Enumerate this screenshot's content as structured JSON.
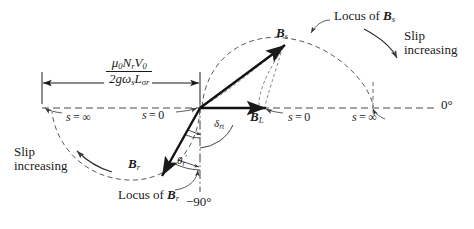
{
  "figure": {
    "type": "phasor-locus-diagram",
    "title": "",
    "origin": {
      "x": 200,
      "y": 108
    },
    "reference_axis_label": "0°",
    "negative_axis_label": "−90°"
  },
  "dimension": {
    "numerator": "μ₀NᵣV₀",
    "numerator_parts": {
      "mu": "μ",
      "mu_sub": "0",
      "N": "N",
      "N_sub": "r",
      "V": "V",
      "V_sub": "0"
    },
    "denominator_parts": {
      "two_g": "2g",
      "omega": "ω",
      "omega_sub": "s",
      "L": "L",
      "L_sub": "σr"
    },
    "span_from_x": 42,
    "span_to_x": 200
  },
  "vectors": [
    {
      "name": "Bs",
      "label_B": "B",
      "label_sub": "s",
      "tip": {
        "x": 285,
        "y": 45
      },
      "label_pos": {
        "x": 276,
        "y": 27
      }
    },
    {
      "name": "BL",
      "label_B": "B",
      "label_sub": "L",
      "tip": {
        "x": 266,
        "y": 108
      },
      "label_pos": {
        "x": 251,
        "y": 110
      }
    },
    {
      "name": "Br",
      "label_B": "B",
      "label_sub": "r",
      "tip": {
        "x": 163,
        "y": 175
      },
      "label_pos": {
        "x": 130,
        "y": 158
      }
    }
  ],
  "angles": [
    {
      "name": "delta_rt",
      "text": "δ",
      "sub": "rt",
      "pos": {
        "x": 216,
        "y": 119
      }
    },
    {
      "name": "theta_r_prime",
      "text": "θ",
      "sub": "r",
      "prime": "′",
      "pos": {
        "x": 179,
        "y": 156
      }
    }
  ],
  "annotations": {
    "locus_s": {
      "prefix": "Locus of ",
      "sym": "B",
      "sub": "s",
      "pos": {
        "x": 330,
        "y": 10
      }
    },
    "locus_r": {
      "prefix": "Locus of ",
      "sym": "B",
      "sub": "r",
      "pos": {
        "x": 119,
        "y": 189
      }
    },
    "slip_increasing_right": {
      "line1": "Slip",
      "line2": "increasing",
      "pos": {
        "x": 406,
        "y": 32
      }
    },
    "slip_increasing_left": {
      "line1": "Slip",
      "line2": "increasing",
      "pos": {
        "x": 17,
        "y": 148
      }
    }
  },
  "slip_marks": [
    {
      "name": "s-zero-center",
      "lhs": "s",
      "eq": "=",
      "rhs": "0",
      "pos": {
        "x": 143,
        "y": 110
      }
    },
    {
      "name": "s-zero-right",
      "lhs": "s",
      "eq": "=",
      "rhs": "0",
      "pos": {
        "x": 286,
        "y": 112
      }
    },
    {
      "name": "s-infinity-left",
      "lhs": "s",
      "eq": "=",
      "rhs": "∞",
      "pos": {
        "x": 61,
        "y": 112
      }
    },
    {
      "name": "s-infinity-right",
      "lhs": "s",
      "eq": "=",
      "rhs": "∞",
      "pos": {
        "x": 357,
        "y": 112
      }
    }
  ],
  "axes": {
    "zero_deg": {
      "text": "0",
      "deg": "°",
      "pos": {
        "x": 443,
        "y": 99
      }
    },
    "minus_ninety": {
      "text": "−90",
      "deg": "°",
      "pos": {
        "x": 191,
        "y": 197
      }
    }
  },
  "colors": {
    "ink": "#1a1a1a",
    "background": "#ffffff"
  }
}
